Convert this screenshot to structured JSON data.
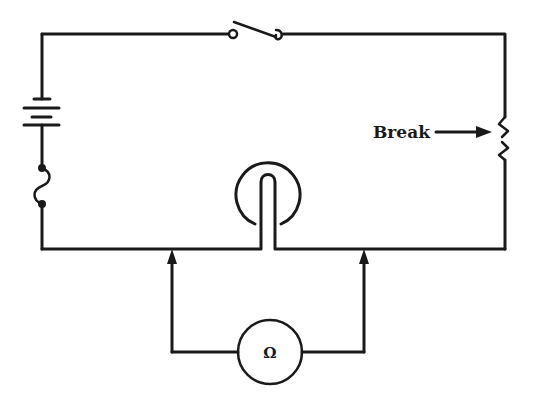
{
  "diagram": {
    "type": "circuit-schematic",
    "background_color": "#ffffff",
    "line_color": "#1a1a1a",
    "components": [
      {
        "id": "battery",
        "kind": "battery",
        "position": "left wire, upper"
      },
      {
        "id": "fuse",
        "kind": "fuse",
        "position": "left wire, lower"
      },
      {
        "id": "switch",
        "kind": "switch",
        "state": "open",
        "position": "top wire"
      },
      {
        "id": "resistor",
        "kind": "resistor",
        "position": "right wire",
        "annotation": "Break"
      },
      {
        "id": "lamp",
        "kind": "lamp",
        "position": "bottom wire, center"
      },
      {
        "id": "ohmmeter",
        "kind": "ohmmeter",
        "symbol": "Ω",
        "position": "below circuit, connected by probes"
      }
    ],
    "labels": {
      "break": "Break",
      "ohmmeter_symbol": "Ω"
    },
    "probes": [
      {
        "id": "probe-left",
        "arrow": "up"
      },
      {
        "id": "probe-right",
        "arrow": "up"
      }
    ]
  }
}
